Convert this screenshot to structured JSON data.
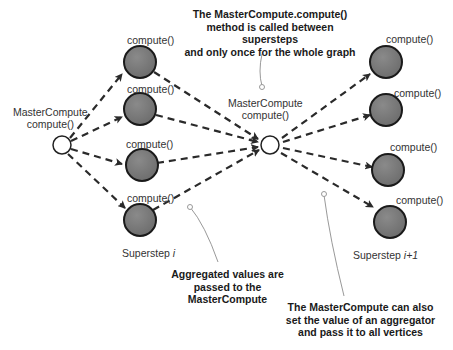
{
  "diagram": {
    "superstep_left": {
      "label": "Superstep",
      "index": "i"
    },
    "superstep_right": {
      "label": "Superstep",
      "index": "i+1"
    },
    "master_left": {
      "line1": "MasterCompute",
      "line2": "compute()"
    },
    "master_center": {
      "line1": "MasterCompute",
      "line2": "compute()"
    },
    "vertex_label": "compute()",
    "left_vertices": [
      "compute()",
      "compute()",
      "compute()",
      "compute()"
    ],
    "right_vertices": [
      "compute()",
      "compute()",
      "compute()",
      "compute()"
    ],
    "notes": {
      "top": [
        "The MasterCompute.compute()",
        "method is called between supersteps",
        "and only once for the whole graph"
      ],
      "aggregated": [
        "Aggregated values are",
        "passed to the",
        "MasterCompute"
      ],
      "set_value": [
        "The MasterCompute can also",
        "set the value of an aggregator",
        "and pass it to all vertices"
      ]
    },
    "colors": {
      "vertex_fill": "#7a7a7a",
      "vertex_stroke": "#1a1a1a",
      "master_fill": "#ffffff",
      "edge": "#2a2a2a",
      "callout": "#999999"
    }
  }
}
